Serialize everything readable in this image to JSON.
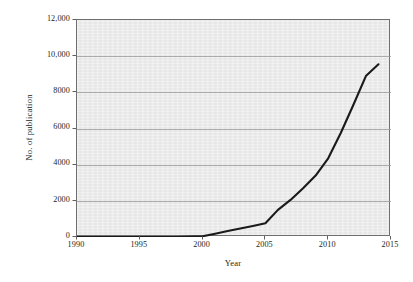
{
  "chart_data": {
    "type": "line",
    "title": "",
    "subtitle": "",
    "xlabel": "Year",
    "ylabel": "No. of publication",
    "xlim": [
      1990,
      2015
    ],
    "ylim": [
      0,
      12000
    ],
    "grid": true,
    "grid_axis": "y",
    "legend": null,
    "legend_position": "none",
    "x_ticks": [
      1990,
      1995,
      2000,
      2005,
      2010,
      2015
    ],
    "x_tick_labels": [
      "1990",
      "1995",
      "2000",
      "2005",
      "2010",
      "2015"
    ],
    "y_ticks": [
      0,
      2000,
      4000,
      6000,
      8000,
      10000,
      12000
    ],
    "y_tick_labels": [
      "0",
      "2000",
      "4000",
      "6000",
      "8000",
      "10,000",
      "12,000"
    ],
    "series": [
      {
        "name": "No. of publication",
        "color": "#1a1a1a",
        "line_width": 2.1,
        "x": [
          1990,
          1995,
          1998,
          2000,
          2001,
          2002,
          2003,
          2004,
          2005,
          2006,
          2007,
          2008,
          2009,
          2010,
          2011,
          2012,
          2013,
          2014
        ],
        "values": [
          0,
          0,
          0,
          40,
          180,
          330,
          470,
          610,
          760,
          1500,
          2050,
          2700,
          3400,
          4350,
          5750,
          7300,
          8900,
          9550
        ]
      }
    ],
    "annotations": [],
    "plot_background": "#ececec",
    "grid_color": "#9a9a9a",
    "frame_color": "#6f6f6f",
    "page_background": "#ffffff"
  },
  "axes": {
    "y_label_text": "No. of publication",
    "x_label_text": "Year"
  }
}
